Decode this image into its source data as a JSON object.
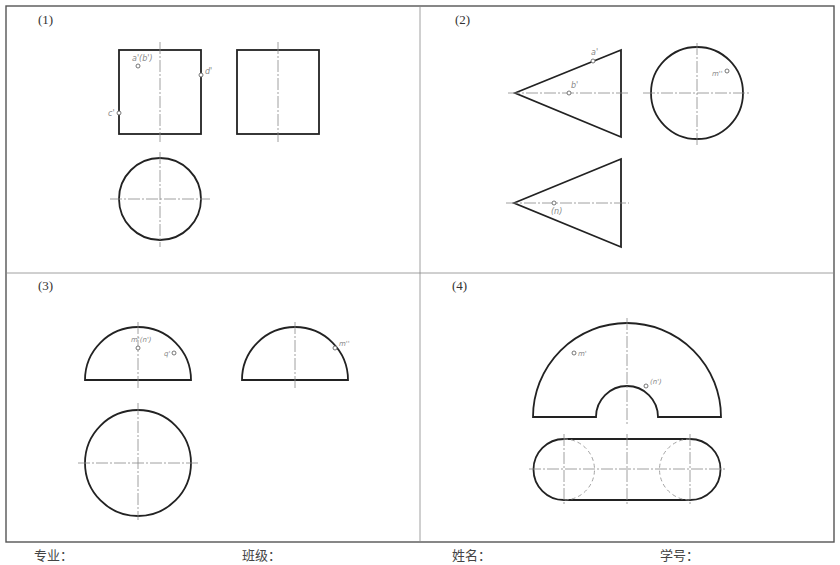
{
  "panels": [
    {
      "id": "1",
      "label": "(1)",
      "shape": "cylinder",
      "views": [
        "front-rectangle",
        "side-rectangle",
        "top-circle"
      ],
      "points": [
        {
          "label": "a'(b')"
        },
        {
          "label": "d'"
        },
        {
          "label": "c'"
        }
      ]
    },
    {
      "id": "2",
      "label": "(2)",
      "shape": "cone",
      "views": [
        "front-triangle",
        "side-circle",
        "top-triangle"
      ],
      "points": [
        {
          "label": "a'"
        },
        {
          "label": "b'"
        },
        {
          "label": "m''"
        },
        {
          "label": "(n)"
        }
      ]
    },
    {
      "id": "3",
      "label": "(3)",
      "shape": "hemisphere",
      "views": [
        "front-semicircle",
        "side-semicircle",
        "top-circle"
      ],
      "points": [
        {
          "label": "m'(n')"
        },
        {
          "label": "q'"
        },
        {
          "label": "m''"
        }
      ]
    },
    {
      "id": "4",
      "label": "(4)",
      "shape": "half-ring",
      "views": [
        "front-half-annulus",
        "top-slot"
      ],
      "points": [
        {
          "label": "m'"
        },
        {
          "label": "(n')"
        }
      ]
    }
  ],
  "footer": {
    "major": "专业：",
    "class": "班级：",
    "name": "姓名：",
    "student_id": "学号："
  },
  "colors": {
    "outline": "#222222",
    "centerline": "#888888",
    "hidden": "#999999",
    "frame": "#555555"
  }
}
